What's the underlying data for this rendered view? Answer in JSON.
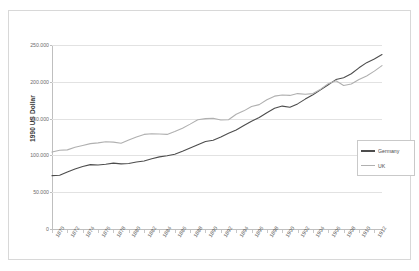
{
  "figure": {
    "top_caption": "",
    "background_color": "#ffffff",
    "frame_color": "#d8d8d8"
  },
  "chart_data": {
    "type": "line",
    "title": "",
    "subtitle": "",
    "xlabel": "",
    "ylabel": "1990 US Dollar",
    "xlim": [
      1870,
      1913
    ],
    "ylim": [
      0,
      250000
    ],
    "grid": true,
    "legend_position": "right-middle",
    "ytick_labels": [
      "0",
      "50.000",
      "100.000",
      "150.000",
      "200.000",
      "250.000"
    ],
    "ytick_values": [
      0,
      50000,
      100000,
      150000,
      200000,
      250000
    ],
    "xtick_labels": [
      "1870",
      "1872",
      "1874",
      "1876",
      "1878",
      "1880",
      "1882",
      "1884",
      "1886",
      "1888",
      "1890",
      "1892",
      "1894",
      "1896",
      "1898",
      "1900",
      "1902",
      "1904",
      "1906",
      "1908",
      "1910",
      "1912"
    ],
    "xtick_values": [
      1870,
      1872,
      1874,
      1876,
      1878,
      1880,
      1882,
      1884,
      1886,
      1888,
      1890,
      1892,
      1894,
      1896,
      1898,
      1900,
      1902,
      1904,
      1906,
      1908,
      1910,
      1912
    ],
    "x": [
      1870,
      1871,
      1872,
      1873,
      1874,
      1875,
      1876,
      1877,
      1878,
      1879,
      1880,
      1881,
      1882,
      1883,
      1884,
      1885,
      1886,
      1887,
      1888,
      1889,
      1890,
      1891,
      1892,
      1893,
      1894,
      1895,
      1896,
      1897,
      1898,
      1899,
      1900,
      1901,
      1902,
      1903,
      1904,
      1905,
      1906,
      1907,
      1908,
      1909,
      1910,
      1911,
      1912,
      1913
    ],
    "series": [
      {
        "name": "Germany",
        "color": "#4d4d4d",
        "values": [
          72500,
          73000,
          77500,
          81500,
          85000,
          87500,
          87000,
          88000,
          89500,
          88500,
          89000,
          91000,
          92500,
          95500,
          98000,
          99500,
          101500,
          105500,
          110000,
          114500,
          119000,
          120500,
          125000,
          130000,
          134500,
          140500,
          146500,
          151500,
          158000,
          164000,
          167000,
          165500,
          170000,
          176500,
          182500,
          189000,
          196000,
          203000,
          205500,
          211000,
          219000,
          226000,
          231000,
          237000
        ]
      },
      {
        "name": "UK",
        "color": "#b0b0b0",
        "values": [
          104500,
          107000,
          107500,
          111000,
          113500,
          116000,
          117000,
          118500,
          118000,
          116500,
          121000,
          125000,
          128500,
          129500,
          129000,
          128500,
          132500,
          137000,
          142500,
          148500,
          150000,
          150500,
          148000,
          148500,
          156000,
          160500,
          166500,
          169000,
          175500,
          180500,
          182000,
          181500,
          184000,
          183000,
          184000,
          190000,
          197500,
          201500,
          195000,
          197000,
          203000,
          208000,
          214500,
          222000
        ]
      }
    ]
  },
  "legend": {
    "items": [
      {
        "label": "Germany",
        "color": "#4d4d4d"
      },
      {
        "label": "UK",
        "color": "#b0b0b0"
      }
    ]
  }
}
